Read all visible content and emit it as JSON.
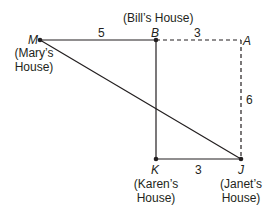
{
  "diagram": {
    "points": {
      "M": {
        "label": "M",
        "caption_line1": "(Mary’s",
        "caption_line2": "House)"
      },
      "B": {
        "label": "B",
        "caption": "(Bill’s House)"
      },
      "A": {
        "label": "A"
      },
      "K": {
        "label": "K",
        "caption_line1": "(Karen’s",
        "caption_line2": "House)"
      },
      "J": {
        "label": "J",
        "caption_line1": "(Janet’s",
        "caption_line2": "House)"
      }
    },
    "segments": {
      "MB": {
        "length": "5",
        "style": "solid"
      },
      "BA": {
        "length": "3",
        "style": "dashed"
      },
      "AJ": {
        "length": "6",
        "style": "dashed"
      },
      "KJ": {
        "length": "3",
        "style": "solid"
      },
      "BK": {
        "style": "solid"
      },
      "MJ": {
        "style": "solid"
      }
    },
    "colors": {
      "line": "#231f20",
      "background": "#ffffff"
    }
  }
}
